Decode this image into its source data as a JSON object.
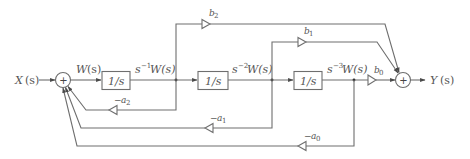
{
  "diagram": {
    "type": "signal-flow block diagram",
    "title": "",
    "input": {
      "label_main": "X",
      "label_arg": "(s)"
    },
    "output": {
      "label_main": "Y",
      "label_arg": "(s)"
    },
    "sum_junctions": [
      {
        "id": "sum-input",
        "symbol": "+"
      },
      {
        "id": "sum-output",
        "symbol": "+"
      }
    ],
    "state_signal": {
      "label_main": "W",
      "label_arg": "(s)"
    },
    "integrators": [
      {
        "label": "1/s",
        "output_prefix": "s",
        "output_exp": "−1",
        "output_suffix": "W(s)"
      },
      {
        "label": "1/s",
        "output_prefix": "s",
        "output_exp": "−2",
        "output_suffix": "W(s)"
      },
      {
        "label": "1/s",
        "output_prefix": "s",
        "output_exp": "−3",
        "output_suffix": "W(s)"
      }
    ],
    "feedforward_gains": [
      {
        "base": "b",
        "sub": "2"
      },
      {
        "base": "b",
        "sub": "1"
      },
      {
        "base": "b",
        "sub": "0"
      }
    ],
    "feedback_gains": [
      {
        "prefix": "−",
        "base": "a",
        "sub": "2"
      },
      {
        "prefix": "−",
        "base": "a",
        "sub": "1"
      },
      {
        "prefix": "−",
        "base": "a",
        "sub": "0"
      }
    ],
    "colors": {
      "line": "#6e6e6e",
      "text": "#555555",
      "background": "#ffffff"
    }
  }
}
